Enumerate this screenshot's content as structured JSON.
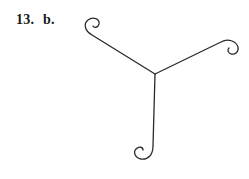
{
  "problem": {
    "number": "13.",
    "part": "b."
  },
  "figure": {
    "stroke_color": "#2a2a2a",
    "arms": [
      "upper-left arm with curl",
      "upper-right arm with curl",
      "downward arm with curl"
    ]
  }
}
